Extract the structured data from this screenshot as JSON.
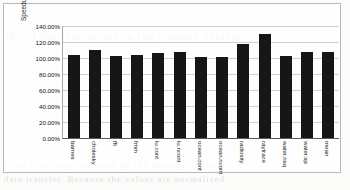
{
  "chart_data": {
    "type": "bar",
    "title": "",
    "xlabel": "",
    "ylabel": "Speedup norm. to software implementation",
    "ylim": [
      0,
      140
    ],
    "ytick_labels": [
      "140.00%",
      "120.00%",
      "100.00%",
      "80.00%",
      "60.00%",
      "40.00%",
      "20.00%",
      "0.00%"
    ],
    "ytick_values": [
      140,
      120,
      100,
      80,
      60,
      40,
      20,
      0
    ],
    "grid": true,
    "legend": "none",
    "series_color": "#161616",
    "categories": [
      "barnes",
      "cholesky",
      "fft",
      "fmm",
      "lu.cont",
      "lu.ncont",
      "ocean.cont",
      "ocean.ncont",
      "radiosity",
      "raytrace",
      "water.nsq",
      "water.sp",
      "mean"
    ],
    "values": [
      103.5,
      110.5,
      103.0,
      104.0,
      106.0,
      107.0,
      101.5,
      101.0,
      118.0,
      129.5,
      102.0,
      107.0,
      107.5
    ],
    "value_unit": "%"
  },
  "scan": {
    "bleed_line_1": "the  of  the  interaction  in  the  memory  system",
    "bleed_line_2": "i and i  are  only  affected  by  the  latency  of  the",
    "bleed_line_3": "data  transfer.  Because  the  values  are  normalized"
  }
}
